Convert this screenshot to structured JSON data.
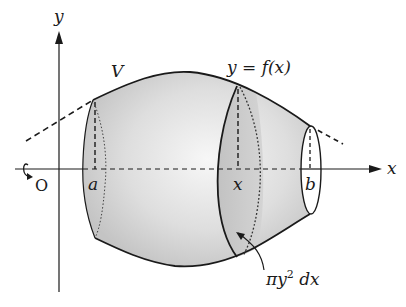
{
  "figure": {
    "labels": {
      "y_axis": "y",
      "x_axis": "x",
      "origin": "O",
      "solid": "V",
      "curve": "y = f(x)",
      "a": "a",
      "x": "x",
      "b": "b",
      "slice_prefix": "πy",
      "slice_exp": "2",
      "slice_suffix": " dx"
    },
    "colors": {
      "ink": "#1a1a1a",
      "solid_fill_light": "#f2f2f2",
      "solid_fill_dark": "#c8c8c8",
      "slice_fill": "#bdbdbd",
      "end_cap": "#ffffff"
    },
    "icons": {
      "rotation": "rotation-arrow-icon"
    }
  }
}
